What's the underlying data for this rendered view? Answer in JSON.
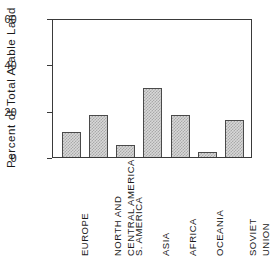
{
  "chart_data": {
    "type": "bar",
    "title": "",
    "subtitle": "",
    "xlabel": "",
    "ylabel": "Percent of Total Arable Land",
    "categories": [
      "EUROPE",
      "NORTH AND CENTRAL AMERICA",
      "S. AMERICA",
      "ASIA",
      "AFRICA",
      "OCEANIA",
      "SOVIET UNION"
    ],
    "category_lines": [
      [
        "EUROPE"
      ],
      [
        "NORTH AND",
        "CENTRAL AMERICA"
      ],
      [
        "S. AMERICA"
      ],
      [
        "ASIA"
      ],
      [
        "AFRICA"
      ],
      [
        "OCEANIA"
      ],
      [
        "SOVIET",
        "UNION"
      ]
    ],
    "values": [
      11,
      18,
      5,
      30,
      18,
      2,
      16
    ],
    "ylim": [
      0,
      60
    ],
    "yticks": [
      0,
      20,
      40,
      60
    ],
    "ytick_labels": [
      "0",
      "20",
      "40",
      "60"
    ],
    "grid": false,
    "legend": null,
    "legend_position": "none",
    "bar_fill": "#d8d8d8",
    "bar_hatch_color": "#a9a9a9",
    "bar_edge_color": "#4a4a4a",
    "axis_color": "#3a3a3a",
    "background": "#ffffff",
    "annotations": []
  }
}
